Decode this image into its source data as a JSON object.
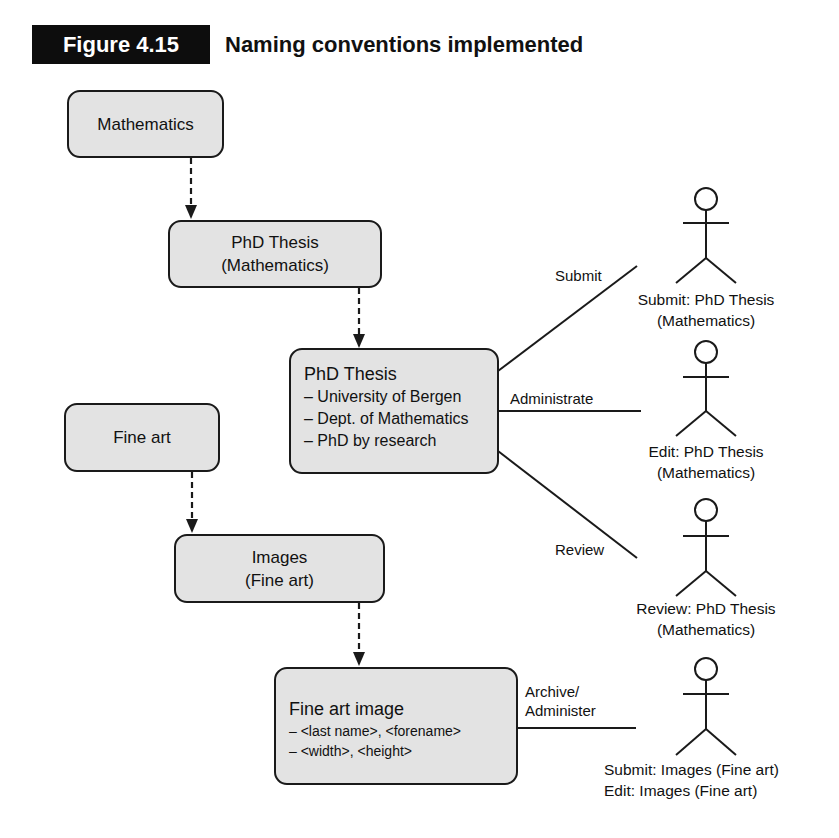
{
  "figure": {
    "label": "Figure 4.15",
    "title": "Naming conventions implemented"
  },
  "nodes": {
    "mathematics": {
      "label": "Mathematics"
    },
    "phd_thesis_math": {
      "line1": "PhD Thesis",
      "line2": "(Mathematics)"
    },
    "phd_thesis_detail": {
      "title": "PhD Thesis",
      "items": [
        "– University of Bergen",
        "– Dept. of Mathematics",
        "– PhD by research"
      ]
    },
    "fine_art": {
      "label": "Fine art"
    },
    "images_fine_art": {
      "line1": "Images",
      "line2": "(Fine art)"
    },
    "fine_art_image": {
      "title": "Fine art image",
      "items": [
        "– <last name>, <forename>",
        "– <width>, <height>"
      ]
    }
  },
  "associations": [
    {
      "label": "Submit"
    },
    {
      "label": "Administrate"
    },
    {
      "label": "Review"
    },
    {
      "line1": "Archive/",
      "line2": "Administer"
    }
  ],
  "actors": [
    {
      "line1": "Submit: PhD Thesis",
      "line2": "(Mathematics)"
    },
    {
      "line1": "Edit: PhD Thesis",
      "line2": "(Mathematics)"
    },
    {
      "line1": "Review: PhD Thesis",
      "line2": "(Mathematics)"
    },
    {
      "line1": "Submit: Images (Fine art)",
      "line2": "Edit: Images (Fine art)"
    }
  ],
  "colors": {
    "box_fill": "#e3e3e3",
    "stroke": "#1a1a1a",
    "label_bg": "#0d0d0d"
  }
}
